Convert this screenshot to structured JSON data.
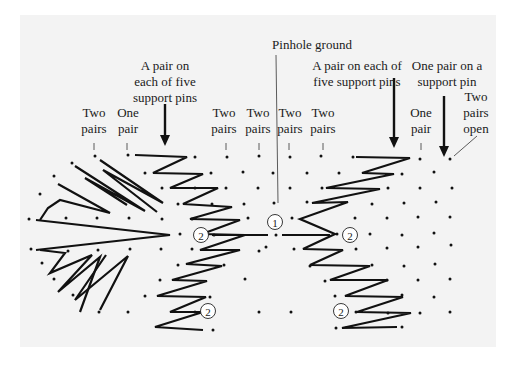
{
  "diagram": {
    "title": "Pinhole ground",
    "background_color": "#f3f3f3",
    "ink_color": "#111111",
    "labels": [
      {
        "id": "pinhole-ground",
        "lines": [
          "Pinhole ground"
        ],
        "x": 312,
        "y": 49
      },
      {
        "id": "left-support-pins",
        "lines": [
          "A pair on",
          "each of five",
          "support pins"
        ],
        "x": 165,
        "y": 70
      },
      {
        "id": "right-support-pins",
        "lines": [
          "A pair on each of",
          "five support pins"
        ],
        "x": 357,
        "y": 70
      },
      {
        "id": "one-pair-support-pin",
        "lines": [
          "One pair on a",
          "support pin"
        ],
        "x": 447,
        "y": 70
      },
      {
        "id": "two-pairs-1",
        "lines": [
          "Two",
          "pairs"
        ],
        "x": 94,
        "y": 117
      },
      {
        "id": "one-pair-1",
        "lines": [
          "One",
          "pair"
        ],
        "x": 128,
        "y": 117
      },
      {
        "id": "two-pairs-2",
        "lines": [
          "Two",
          "pairs"
        ],
        "x": 224,
        "y": 117
      },
      {
        "id": "two-pairs-3",
        "lines": [
          "Two",
          "pairs"
        ],
        "x": 258,
        "y": 117
      },
      {
        "id": "two-pairs-4",
        "lines": [
          "Two",
          "pairs"
        ],
        "x": 290,
        "y": 117
      },
      {
        "id": "two-pairs-5",
        "lines": [
          "Two",
          "pairs"
        ],
        "x": 323,
        "y": 117
      },
      {
        "id": "one-pair-2",
        "lines": [
          "One",
          "pair"
        ],
        "x": 421,
        "y": 117
      },
      {
        "id": "two-pairs-open",
        "lines": [
          "Two",
          "pairs",
          "open"
        ],
        "x": 476,
        "y": 101
      }
    ],
    "leaders": [
      {
        "x1": 94,
        "y1": 143,
        "x2": 94,
        "y2": 150
      },
      {
        "x1": 127,
        "y1": 143,
        "x2": 127,
        "y2": 150
      },
      {
        "x1": 226,
        "y1": 143,
        "x2": 226,
        "y2": 150
      },
      {
        "x1": 259,
        "y1": 143,
        "x2": 259,
        "y2": 150
      },
      {
        "x1": 289,
        "y1": 143,
        "x2": 289,
        "y2": 150
      },
      {
        "x1": 323,
        "y1": 143,
        "x2": 323,
        "y2": 150
      },
      {
        "x1": 421,
        "y1": 143,
        "x2": 421,
        "y2": 150
      },
      {
        "x1": 276,
        "y1": 55,
        "x2": 278,
        "y2": 203
      },
      {
        "x1": 477,
        "y1": 136,
        "x2": 454,
        "y2": 156
      }
    ],
    "arrows": [
      {
        "id": "arrow-left-support",
        "x": 165,
        "y1": 104,
        "y2": 146
      },
      {
        "id": "arrow-right-support",
        "x": 394,
        "y1": 78,
        "y2": 148
      },
      {
        "id": "arrow-one-pair-support",
        "x": 444,
        "y1": 96,
        "y2": 157
      }
    ],
    "markers": [
      {
        "label": "2",
        "x": 201,
        "y": 235
      },
      {
        "label": "1",
        "x": 275,
        "y": 222
      },
      {
        "label": "2",
        "x": 350,
        "y": 235
      },
      {
        "label": "2",
        "x": 208,
        "y": 311
      },
      {
        "label": "2",
        "x": 341,
        "y": 311
      }
    ],
    "pins": [
      [
        95,
        156
      ],
      [
        128,
        155
      ],
      [
        195,
        157
      ],
      [
        227,
        157
      ],
      [
        259,
        156
      ],
      [
        290,
        157
      ],
      [
        321,
        156
      ],
      [
        353,
        157
      ],
      [
        420,
        159
      ],
      [
        450,
        159
      ],
      [
        72,
        163
      ],
      [
        145,
        173
      ],
      [
        211,
        173
      ],
      [
        243,
        172
      ],
      [
        273,
        173
      ],
      [
        307,
        173
      ],
      [
        339,
        173
      ],
      [
        402,
        174
      ],
      [
        434,
        172
      ],
      [
        54,
        176
      ],
      [
        162,
        188
      ],
      [
        195,
        188
      ],
      [
        226,
        188
      ],
      [
        258,
        188
      ],
      [
        290,
        188
      ],
      [
        322,
        188
      ],
      [
        388,
        188
      ],
      [
        420,
        188
      ],
      [
        452,
        188
      ],
      [
        40,
        194
      ],
      [
        178,
        204
      ],
      [
        212,
        204
      ],
      [
        244,
        204
      ],
      [
        274,
        203
      ],
      [
        307,
        202
      ],
      [
        372,
        204
      ],
      [
        404,
        203
      ],
      [
        436,
        202
      ],
      [
        29,
        219
      ],
      [
        66,
        218
      ],
      [
        97,
        218
      ],
      [
        129,
        218
      ],
      [
        162,
        219
      ],
      [
        192,
        219
      ],
      [
        248,
        218
      ],
      [
        292,
        218
      ],
      [
        355,
        218
      ],
      [
        387,
        218
      ],
      [
        418,
        217
      ],
      [
        450,
        217
      ],
      [
        180,
        234
      ],
      [
        214,
        235
      ],
      [
        276,
        235
      ],
      [
        337,
        234
      ],
      [
        370,
        234
      ],
      [
        402,
        235
      ],
      [
        434,
        233
      ],
      [
        31,
        249
      ],
      [
        68,
        251
      ],
      [
        98,
        250
      ],
      [
        130,
        249
      ],
      [
        161,
        249
      ],
      [
        192,
        249
      ],
      [
        259,
        251
      ],
      [
        266,
        247
      ],
      [
        294,
        249
      ],
      [
        356,
        249
      ],
      [
        387,
        248
      ],
      [
        418,
        247
      ],
      [
        451,
        245
      ],
      [
        42,
        263
      ],
      [
        178,
        265
      ],
      [
        224,
        265
      ],
      [
        310,
        266
      ],
      [
        372,
        265
      ],
      [
        404,
        266
      ],
      [
        435,
        264
      ],
      [
        54,
        279
      ],
      [
        160,
        280
      ],
      [
        245,
        279
      ],
      [
        325,
        281
      ],
      [
        387,
        280
      ],
      [
        418,
        280
      ],
      [
        450,
        279
      ],
      [
        73,
        295
      ],
      [
        145,
        296
      ],
      [
        210,
        297
      ],
      [
        335,
        296
      ],
      [
        402,
        295
      ],
      [
        434,
        297
      ],
      [
        99,
        312
      ],
      [
        128,
        312
      ],
      [
        195,
        312
      ],
      [
        259,
        312
      ],
      [
        291,
        312
      ],
      [
        356,
        312
      ],
      [
        388,
        313
      ],
      [
        420,
        313
      ],
      [
        450,
        312
      ],
      [
        213,
        330
      ],
      [
        336,
        328
      ],
      [
        402,
        327
      ]
    ],
    "threads": [
      {
        "id": "left-fan-upper-1",
        "points": [
          [
            100,
            160
          ],
          [
            163,
            203
          ],
          [
            103,
            170
          ],
          [
            157,
            212
          ]
        ]
      },
      {
        "id": "left-fan-upper-2",
        "points": [
          [
            75,
            166
          ],
          [
            145,
            211
          ],
          [
            85,
            178
          ],
          [
            127,
            205
          ]
        ]
      },
      {
        "id": "left-fan-upper-3",
        "points": [
          [
            58,
            184
          ],
          [
            110,
            213
          ],
          [
            60,
            200
          ],
          [
            48,
            208
          ],
          [
            40,
            220
          ]
        ]
      },
      {
        "id": "left-fan-spine",
        "points": [
          [
            36,
            220
          ],
          [
            170,
            235
          ],
          [
            36,
            250
          ]
        ]
      },
      {
        "id": "left-fan-lower-1",
        "points": [
          [
            40,
            250
          ],
          [
            65,
            253
          ],
          [
            50,
            273
          ],
          [
            92,
            255
          ],
          [
            58,
            292
          ],
          [
            100,
            257
          ],
          [
            80,
            312
          ]
        ]
      },
      {
        "id": "left-fan-lower-2",
        "points": [
          [
            106,
            255
          ],
          [
            75,
            300
          ],
          [
            128,
            256
          ],
          [
            100,
            310
          ]
        ]
      },
      {
        "id": "left-zigzag",
        "points": [
          [
            135,
            155
          ],
          [
            187,
            157
          ],
          [
            153,
            173
          ],
          [
            203,
            174
          ],
          [
            170,
            188
          ],
          [
            218,
            188
          ],
          [
            183,
            204
          ],
          [
            232,
            207
          ],
          [
            190,
            219
          ],
          [
            240,
            220
          ],
          [
            202,
            234
          ],
          [
            245,
            235
          ],
          [
            200,
            250
          ],
          [
            240,
            250
          ],
          [
            186,
            264
          ],
          [
            222,
            266
          ],
          [
            172,
            280
          ],
          [
            207,
            281
          ],
          [
            157,
            296
          ],
          [
            206,
            297
          ],
          [
            170,
            312
          ],
          [
            203,
            312
          ],
          [
            155,
            327
          ],
          [
            203,
            330
          ]
        ]
      },
      {
        "id": "center-bar",
        "points": [
          [
            212,
            235
          ],
          [
            268,
            235
          ]
        ]
      },
      {
        "id": "center-bar-right",
        "points": [
          [
            282,
            235
          ],
          [
            330,
            235
          ]
        ]
      },
      {
        "id": "right-zigzag",
        "points": [
          [
            356,
            157
          ],
          [
            410,
            158
          ],
          [
            362,
            173
          ],
          [
            394,
            174
          ],
          [
            326,
            188
          ],
          [
            380,
            189
          ],
          [
            312,
            203
          ],
          [
            348,
            202
          ],
          [
            300,
            219
          ],
          [
            335,
            234
          ],
          [
            303,
            249
          ],
          [
            343,
            250
          ],
          [
            310,
            265
          ],
          [
            370,
            266
          ],
          [
            330,
            280
          ],
          [
            388,
            280
          ],
          [
            345,
            296
          ],
          [
            403,
            297
          ],
          [
            357,
            312
          ],
          [
            411,
            313
          ],
          [
            342,
            328
          ],
          [
            397,
            327
          ]
        ]
      }
    ]
  }
}
